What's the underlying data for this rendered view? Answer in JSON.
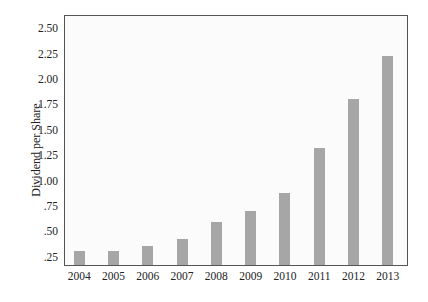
{
  "chart_data": {
    "type": "bar",
    "title": "",
    "xlabel": "",
    "ylabel": "Dividend per Share",
    "categories": [
      "2004",
      "2005",
      "2006",
      "2007",
      "2008",
      "2009",
      "2010",
      "2011",
      "2012",
      "2013"
    ],
    "values": [
      0.31,
      0.31,
      0.36,
      0.43,
      0.59,
      0.7,
      0.88,
      1.32,
      1.8,
      2.23
    ],
    "yticks": [
      ".25",
      ".50",
      ".75",
      "1.00",
      "1.25",
      "1.50",
      "1.75",
      "2.00",
      "2.25",
      "2.50"
    ],
    "ylim": [
      0.17,
      2.63
    ],
    "grid": false,
    "legend": null,
    "bar_color": "#a6a6a6"
  }
}
